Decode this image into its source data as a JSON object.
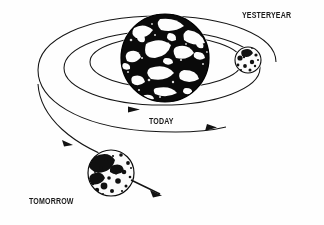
{
  "figure": {
    "background_color": "#fefefe",
    "ink_color": "#111111",
    "width": 324,
    "height": 225
  },
  "labels": {
    "yesteryear": "YESTERYEAR",
    "today": "TODAY",
    "tomorrow": "TOMORROW"
  },
  "bodies": {
    "earth": {
      "name": "Earth",
      "center_x": 165,
      "center_y": 58,
      "radius": 44,
      "style": "halftone-dark"
    },
    "moon_yesteryear": {
      "name": "Moon (yesteryear)",
      "center_x": 248,
      "center_y": 60,
      "radius": 13,
      "style": "halftone-light"
    },
    "moon_tomorrow": {
      "name": "Moon (tomorrow)",
      "center_x": 111,
      "center_y": 173,
      "radius": 23,
      "style": "halftone-light"
    }
  },
  "orbits": [
    {
      "name": "orbit-yesteryear",
      "rx": 76,
      "ry": 26,
      "note": "innermost, smallest past orbit"
    },
    {
      "name": "orbit-today",
      "rx": 98,
      "ry": 36,
      "note": "middle, present-day orbit"
    },
    {
      "name": "orbit-tomorrow",
      "rx": 120,
      "ry": 47,
      "note": "outermost, future widened orbit"
    }
  ],
  "arrows": {
    "orbit_direction": "counterclockwise-viewed-from-above",
    "escape_arrow": "moon receding outward, down-right"
  }
}
